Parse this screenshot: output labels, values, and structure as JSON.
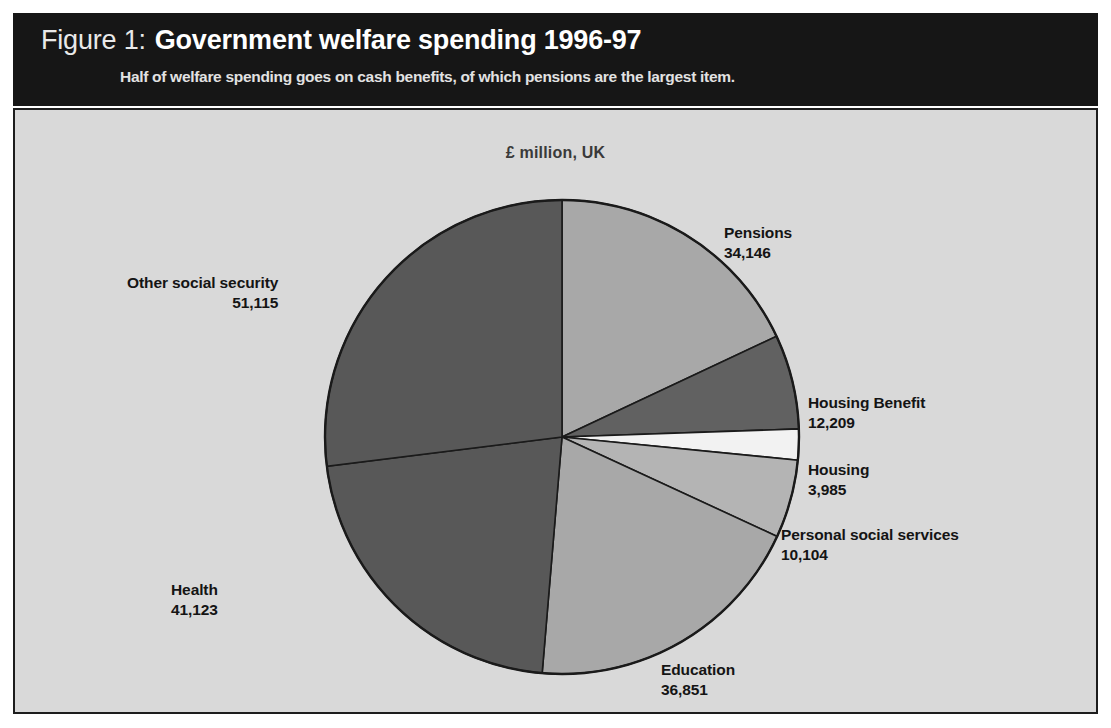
{
  "figure": {
    "label": "Figure 1:",
    "title": "Government welfare spending 1996-97",
    "subtitle": "Half of welfare spending goes on cash benefits, of which pensions are the largest item."
  },
  "chart_data": {
    "type": "pie",
    "title": "Government welfare spending 1996-97",
    "subtitle": "Half of welfare spending goes on cash benefits, of which pensions are the largest item.",
    "unit_label": "£ million, UK",
    "ylabel": "",
    "xlabel": "",
    "legend_position": "callout-labels",
    "grid": false,
    "start_angle_deg": 0,
    "direction": "clockwise",
    "total": 189533,
    "categories": [
      "Pensions",
      "Housing Benefit",
      "Housing",
      "Personal social services",
      "Education",
      "Health",
      "Other social security"
    ],
    "values": [
      34146,
      12209,
      3985,
      10104,
      36851,
      41123,
      51115
    ],
    "slices": [
      {
        "label": "Pensions",
        "value": 34146,
        "value_text": "34,146",
        "color": "#a8a8a8",
        "align": "left"
      },
      {
        "label": "Housing Benefit",
        "value": 12209,
        "value_text": "12,209",
        "color": "#616161",
        "align": "left"
      },
      {
        "label": "Housing",
        "value": 3985,
        "value_text": "3,985",
        "color": "#f2f2f2",
        "align": "left"
      },
      {
        "label": "Personal social services",
        "value": 10104,
        "value_text": "10,104",
        "color": "#b4b4b4",
        "align": "left"
      },
      {
        "label": "Education",
        "value": 36851,
        "value_text": "36,851",
        "color": "#a8a8a8",
        "align": "left"
      },
      {
        "label": "Health",
        "value": 41123,
        "value_text": "41,123",
        "color": "#585858",
        "align": "right"
      },
      {
        "label": "Other social security",
        "value": 51115,
        "value_text": "51,115",
        "color": "#585858",
        "align": "right"
      }
    ]
  },
  "colors": {
    "header_background": "#161616",
    "panel_background": "#d9d9d9",
    "panel_border": "#1d1d1d",
    "text_dark": "#141414",
    "text_light": "#ffffff"
  }
}
